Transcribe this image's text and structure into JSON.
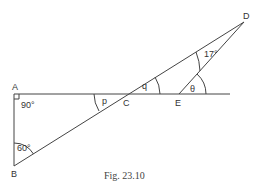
{
  "figure": {
    "caption": "Fig. 23.10",
    "points": {
      "A": {
        "label": "A",
        "x": 14,
        "y": 94
      },
      "B": {
        "label": "B",
        "x": 14,
        "y": 166
      },
      "C": {
        "label": "C",
        "x": 127,
        "y": 94
      },
      "D": {
        "label": "D",
        "x": 244,
        "y": 22
      },
      "E": {
        "label": "E",
        "x": 179,
        "y": 94
      }
    },
    "angles": {
      "A": "90°",
      "B": "60°",
      "p": "p",
      "q": "q",
      "D": "17°",
      "theta": "θ"
    },
    "line_end_x": 230
  }
}
